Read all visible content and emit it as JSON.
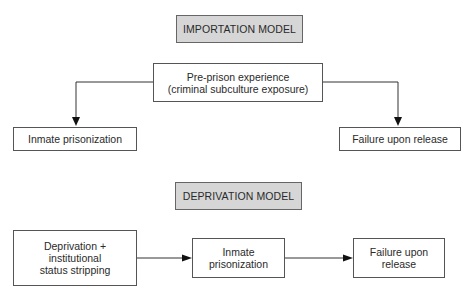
{
  "importation": {
    "title": "IMPORTATION MODEL",
    "source": {
      "line1": "Pre-prison experience",
      "line2": "(criminal subculture exposure)"
    },
    "left_outcome": "Inmate prisonization",
    "right_outcome": "Failure upon release"
  },
  "deprivation": {
    "title": "DEPRIVATION MODEL",
    "step1": {
      "line1": "Deprivation +",
      "line2": "institutional",
      "line3": "status stripping"
    },
    "step2": {
      "line1": "Inmate",
      "line2": "prisonization"
    },
    "step3": {
      "line1": "Failure upon",
      "line2": "release"
    }
  },
  "colors": {
    "title_fill": "#d6d6d6",
    "stroke": "#555555",
    "arrowhead": "#111111"
  }
}
